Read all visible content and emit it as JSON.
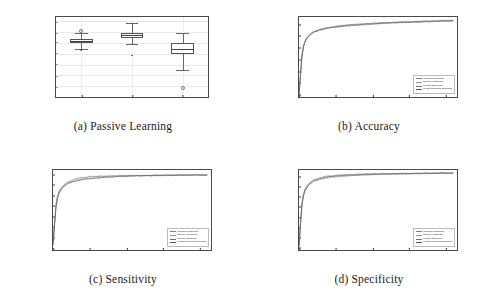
{
  "figure": {
    "panels": [
      {
        "key": "a",
        "caption": "(a) Passive Learning",
        "type": "box"
      },
      {
        "key": "b",
        "caption": "(b) Accuracy",
        "type": "line"
      },
      {
        "key": "c",
        "caption": "(c) Sensitivity",
        "type": "line"
      },
      {
        "key": "d",
        "caption": "(d) Specificity",
        "type": "line"
      }
    ]
  },
  "legend": {
    "entries": [
      {
        "label": "Random Sampling",
        "color": "#7f7f7f"
      },
      {
        "label": "Entropy Sampling",
        "color": "#9a9a9a"
      },
      {
        "label": "Margin Sampling",
        "color": "#6e6e6e"
      },
      {
        "label": "Least Confident Sampling",
        "color": "#555555"
      }
    ]
  },
  "chart_data": [
    {
      "type": "box",
      "title": "(a) Passive Learning",
      "xlabel": "",
      "ylabel": "",
      "categories": [
        "accuracy",
        "sensitivity",
        "specificity"
      ],
      "ylim": [
        0.55,
        0.92
      ],
      "yticks": [
        0.9,
        0.85,
        0.8,
        0.75,
        0.7,
        0.65,
        0.6
      ],
      "ytick_labels": [
        "0.90",
        "0.85",
        "0.80",
        "0.75",
        "0.70",
        "0.65",
        "0.60"
      ],
      "grid": true,
      "boxes": [
        {
          "category": "accuracy",
          "whisker_low": 0.772,
          "q1": 0.8,
          "median": 0.809,
          "q3": 0.818,
          "whisker_high": 0.845,
          "outliers": [
            0.855,
            0.77,
            0.769,
            0.768
          ]
        },
        {
          "category": "sensitivity",
          "whisker_low": 0.797,
          "q1": 0.824,
          "median": 0.838,
          "q3": 0.848,
          "whisker_high": 0.893,
          "outliers": [
            0.893,
            0.891,
            0.745,
            0.743,
            0.741,
            0.739
          ]
        },
        {
          "category": "specificity",
          "whisker_low": 0.676,
          "q1": 0.748,
          "median": 0.772,
          "q3": 0.8,
          "whisker_high": 0.845,
          "outliers": [
            0.592
          ]
        }
      ]
    },
    {
      "type": "line",
      "title": "(b) Accuracy",
      "xlabel": "queries",
      "ylabel": "",
      "xlim": [
        0,
        215
      ],
      "ylim": [
        0.49,
        0.83
      ],
      "xticks": [
        0,
        50,
        100,
        150,
        200
      ],
      "xtick_labels": [
        "0",
        "50",
        "100",
        "150",
        "200"
      ],
      "yticks": [
        0.8,
        0.75,
        0.7,
        0.65,
        0.6,
        0.55,
        0.5
      ],
      "ytick_labels": [
        "0.80",
        "0.75",
        "0.70",
        "0.65",
        "0.60",
        "0.55",
        "0.50"
      ],
      "grid": false,
      "legend_position": "lower right",
      "x": [
        0,
        2,
        4,
        6,
        8,
        10,
        14,
        18,
        22,
        26,
        30,
        40,
        50,
        60,
        70,
        80,
        90,
        100,
        110,
        120,
        130,
        140,
        150,
        160,
        170,
        180,
        190,
        200,
        210
      ],
      "series": [
        {
          "name": "Random Sampling",
          "values": [
            0.5,
            0.585,
            0.668,
            0.706,
            0.725,
            0.737,
            0.752,
            0.761,
            0.767,
            0.771,
            0.775,
            0.781,
            0.786,
            0.79,
            0.793,
            0.795,
            0.797,
            0.799,
            0.801,
            0.803,
            0.804,
            0.806,
            0.807,
            0.808,
            0.809,
            0.81,
            0.811,
            0.812,
            0.813
          ]
        },
        {
          "name": "Entropy Sampling",
          "values": [
            0.5,
            0.58,
            0.663,
            0.703,
            0.723,
            0.736,
            0.752,
            0.762,
            0.769,
            0.774,
            0.778,
            0.784,
            0.789,
            0.793,
            0.796,
            0.798,
            0.8,
            0.802,
            0.804,
            0.806,
            0.807,
            0.808,
            0.809,
            0.81,
            0.811,
            0.812,
            0.813,
            0.814,
            0.815
          ]
        },
        {
          "name": "Margin Sampling",
          "values": [
            0.5,
            0.583,
            0.666,
            0.705,
            0.726,
            0.739,
            0.754,
            0.764,
            0.77,
            0.775,
            0.779,
            0.785,
            0.79,
            0.794,
            0.797,
            0.799,
            0.801,
            0.803,
            0.805,
            0.806,
            0.808,
            0.809,
            0.81,
            0.811,
            0.812,
            0.813,
            0.814,
            0.815,
            0.816
          ]
        },
        {
          "name": "Least Confident Sampling",
          "values": [
            0.5,
            0.578,
            0.661,
            0.701,
            0.722,
            0.735,
            0.751,
            0.761,
            0.768,
            0.773,
            0.777,
            0.783,
            0.788,
            0.792,
            0.795,
            0.797,
            0.799,
            0.801,
            0.803,
            0.805,
            0.806,
            0.807,
            0.808,
            0.809,
            0.811,
            0.812,
            0.813,
            0.814,
            0.815
          ]
        }
      ]
    },
    {
      "type": "line",
      "title": "(c) Sensitivity",
      "xlabel": "queries",
      "ylabel": "",
      "xlim": [
        0,
        215
      ],
      "ylim": [
        0.49,
        0.87
      ],
      "xticks": [
        0,
        50,
        100,
        150,
        200
      ],
      "xtick_labels": [
        "0",
        "50",
        "100",
        "150",
        "200"
      ],
      "yticks": [
        0.85,
        0.8,
        0.75,
        0.7,
        0.65,
        0.6,
        0.55
      ],
      "ytick_labels": [
        "0.85",
        "0.80",
        "0.75",
        "0.70",
        "0.65",
        "0.60",
        "0.55"
      ],
      "grid": false,
      "legend_position": "lower right",
      "x": [
        0,
        2,
        4,
        6,
        8,
        10,
        14,
        18,
        22,
        26,
        30,
        40,
        50,
        60,
        70,
        80,
        90,
        100,
        110,
        120,
        130,
        140,
        150,
        160,
        170,
        180,
        190,
        200,
        210
      ],
      "series": [
        {
          "name": "Random Sampling",
          "values": [
            0.515,
            0.612,
            0.7,
            0.74,
            0.762,
            0.775,
            0.792,
            0.802,
            0.809,
            0.814,
            0.818,
            0.824,
            0.829,
            0.832,
            0.835,
            0.837,
            0.839,
            0.84,
            0.841,
            0.842,
            0.843,
            0.843,
            0.844,
            0.844,
            0.845,
            0.845,
            0.846,
            0.846,
            0.846
          ]
        },
        {
          "name": "Entropy Sampling",
          "values": [
            0.515,
            0.606,
            0.694,
            0.736,
            0.759,
            0.773,
            0.791,
            0.803,
            0.812,
            0.818,
            0.823,
            0.831,
            0.836,
            0.838,
            0.839,
            0.84,
            0.841,
            0.842,
            0.843,
            0.843,
            0.844,
            0.844,
            0.845,
            0.845,
            0.846,
            0.846,
            0.846,
            0.847,
            0.847
          ]
        },
        {
          "name": "Margin Sampling",
          "values": [
            0.515,
            0.616,
            0.704,
            0.744,
            0.766,
            0.78,
            0.797,
            0.808,
            0.816,
            0.822,
            0.827,
            0.834,
            0.838,
            0.84,
            0.841,
            0.842,
            0.843,
            0.843,
            0.844,
            0.844,
            0.845,
            0.845,
            0.846,
            0.846,
            0.846,
            0.847,
            0.847,
            0.847,
            0.847
          ]
        },
        {
          "name": "Least Confident Sampling",
          "values": [
            0.515,
            0.602,
            0.69,
            0.733,
            0.756,
            0.77,
            0.789,
            0.8,
            0.808,
            0.813,
            0.817,
            0.824,
            0.829,
            0.833,
            0.836,
            0.838,
            0.84,
            0.841,
            0.842,
            0.843,
            0.843,
            0.844,
            0.844,
            0.845,
            0.845,
            0.846,
            0.846,
            0.846,
            0.847
          ]
        }
      ]
    },
    {
      "type": "line",
      "title": "(d) Specificity",
      "xlabel": "queries",
      "ylabel": "",
      "xlim": [
        0,
        215
      ],
      "ylim": [
        0.39,
        0.78
      ],
      "xticks": [
        0,
        50,
        100,
        150,
        200
      ],
      "xtick_labels": [
        "0",
        "50",
        "100",
        "150",
        "200"
      ],
      "yticks": [
        0.75,
        0.7,
        0.65,
        0.6,
        0.55,
        0.5,
        0.45,
        0.4
      ],
      "ytick_labels": [
        "0.75",
        "0.70",
        "0.65",
        "0.60",
        "0.55",
        "0.50",
        "0.45",
        "0.40"
      ],
      "grid": false,
      "legend_position": "lower right",
      "x": [
        0,
        2,
        4,
        6,
        8,
        10,
        14,
        18,
        22,
        26,
        30,
        40,
        50,
        60,
        70,
        80,
        90,
        100,
        110,
        120,
        130,
        140,
        150,
        160,
        170,
        180,
        190,
        200,
        210
      ],
      "series": [
        {
          "name": "Random Sampling",
          "values": [
            0.408,
            0.52,
            0.614,
            0.658,
            0.681,
            0.695,
            0.712,
            0.722,
            0.728,
            0.733,
            0.736,
            0.742,
            0.746,
            0.749,
            0.752,
            0.754,
            0.755,
            0.757,
            0.758,
            0.759,
            0.76,
            0.76,
            0.761,
            0.762,
            0.762,
            0.763,
            0.763,
            0.764,
            0.764
          ]
        },
        {
          "name": "Entropy Sampling",
          "values": [
            0.408,
            0.515,
            0.609,
            0.654,
            0.678,
            0.693,
            0.712,
            0.723,
            0.731,
            0.736,
            0.74,
            0.747,
            0.751,
            0.754,
            0.756,
            0.757,
            0.759,
            0.76,
            0.761,
            0.761,
            0.762,
            0.762,
            0.763,
            0.763,
            0.764,
            0.764,
            0.765,
            0.765,
            0.765
          ]
        },
        {
          "name": "Margin Sampling",
          "values": [
            0.408,
            0.524,
            0.618,
            0.662,
            0.686,
            0.7,
            0.718,
            0.728,
            0.735,
            0.74,
            0.744,
            0.75,
            0.753,
            0.756,
            0.757,
            0.759,
            0.76,
            0.761,
            0.761,
            0.762,
            0.762,
            0.763,
            0.763,
            0.764,
            0.764,
            0.765,
            0.765,
            0.766,
            0.766
          ]
        },
        {
          "name": "Least Confident Sampling",
          "values": [
            0.408,
            0.511,
            0.605,
            0.651,
            0.675,
            0.69,
            0.71,
            0.721,
            0.729,
            0.734,
            0.739,
            0.746,
            0.75,
            0.753,
            0.755,
            0.757,
            0.758,
            0.759,
            0.76,
            0.761,
            0.762,
            0.762,
            0.763,
            0.763,
            0.764,
            0.764,
            0.765,
            0.765,
            0.766
          ]
        }
      ]
    }
  ]
}
